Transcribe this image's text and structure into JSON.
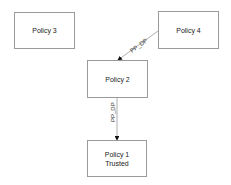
{
  "nodes": [
    {
      "id": "policy3",
      "label": "Policy 3",
      "sub": ""
    },
    {
      "id": "policy4",
      "label": "Policy 4",
      "sub": ""
    },
    {
      "id": "policy2",
      "label": "Policy 2",
      "sub": ""
    },
    {
      "id": "policy1",
      "label": "Policy 1",
      "sub": "Trusted"
    }
  ],
  "edges": [
    {
      "from": "policy4",
      "to": "policy2",
      "label": "PP_DP"
    },
    {
      "from": "policy2",
      "to": "policy1",
      "label": "PP_DP"
    }
  ]
}
